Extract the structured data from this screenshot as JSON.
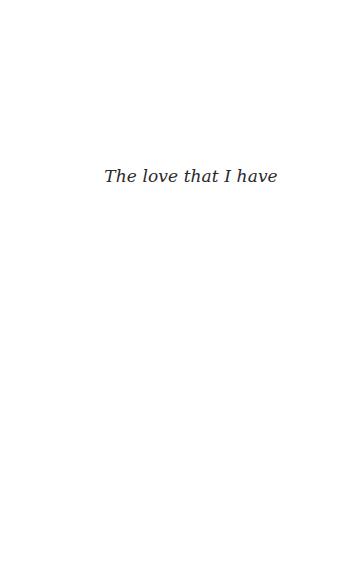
{
  "page": {
    "epigraph": "The love that I have"
  },
  "colors": {
    "background": "#ffffff",
    "text": "#2a2a2a"
  }
}
